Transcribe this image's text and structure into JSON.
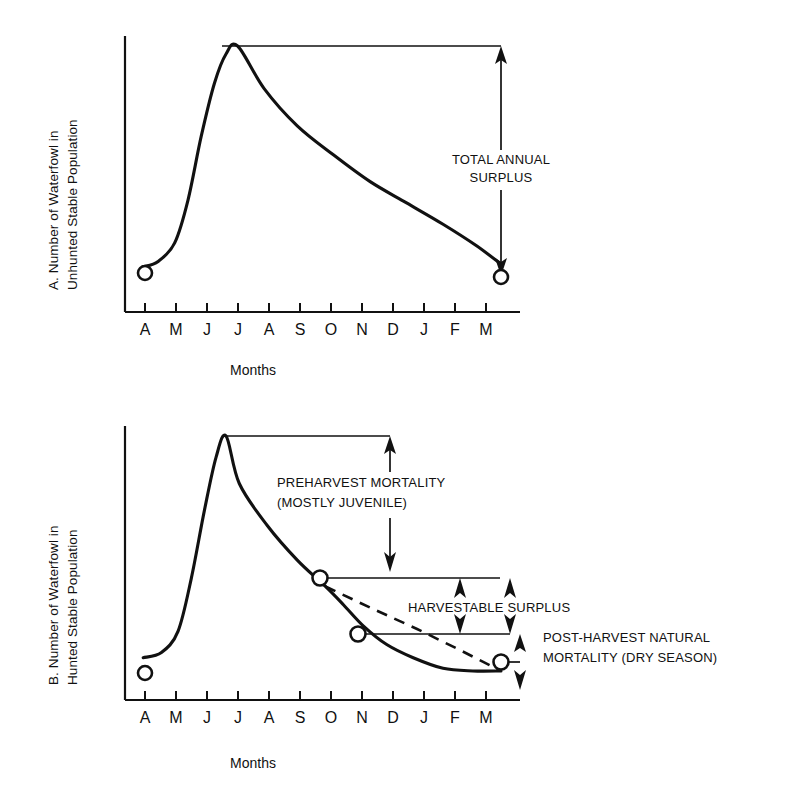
{
  "figure": {
    "background": "#ffffff",
    "line_color": "#111111"
  },
  "chart_data": [
    {
      "id": "panel-a",
      "type": "line",
      "title": "",
      "panel_letter": "A",
      "ylabel_line1": "A. Number of Waterfowl in",
      "ylabel_line2": "Unhunted Stable Population",
      "xlabel": "Months",
      "categories": [
        "A",
        "M",
        "J",
        "J",
        "A",
        "S",
        "O",
        "N",
        "D",
        "J",
        "F",
        "M"
      ],
      "tick_labels": [
        "A",
        "M",
        "J",
        "J",
        "A",
        "S",
        "O",
        "N",
        "D",
        "J",
        "F",
        "M"
      ],
      "grid": false,
      "legend": "none",
      "axis_ranges": {
        "x": [
          0,
          12
        ],
        "y": [
          0,
          100
        ]
      },
      "series": [
        {
          "name": "Unhunted stable population",
          "style": "solid",
          "comment": "Breeding-season recruitment peak in early July, then smooth decline back to the spring level.",
          "x": [
            0.55,
            1.0,
            1.5,
            1.9,
            2.3,
            2.7,
            3.05,
            3.4,
            4.2,
            5.2,
            6.3,
            7.4,
            8.5,
            9.6,
            10.6,
            11.35
          ],
          "values": [
            17,
            19,
            26,
            42,
            66,
            86,
            97,
            100,
            84,
            70,
            59,
            49,
            41,
            33,
            25,
            18
          ]
        }
      ],
      "markers": [
        {
          "name": "spring-start-point",
          "x": 0.55,
          "y": 17
        },
        {
          "name": "spring-end-point",
          "x": 11.35,
          "y": 18
        }
      ],
      "annotations": [
        {
          "name": "total-annual-surplus",
          "lines": [
            "TOTAL ANNUAL",
            "SURPLUS"
          ],
          "arrow": "double-vertical",
          "from_y": 100,
          "to_y": 18,
          "at_x": 11.35
        }
      ]
    },
    {
      "id": "panel-b",
      "type": "line",
      "title": "",
      "panel_letter": "B",
      "ylabel_line1": "B. Number of Waterfowl in",
      "ylabel_line2": "Hunted Stable Population",
      "xlabel": "Months",
      "categories": [
        "A",
        "M",
        "J",
        "J",
        "A",
        "S",
        "O",
        "N",
        "D",
        "J",
        "F",
        "M"
      ],
      "tick_labels": [
        "A",
        "M",
        "J",
        "J",
        "A",
        "S",
        "O",
        "N",
        "D",
        "J",
        "F",
        "M"
      ],
      "grid": false,
      "legend": "none",
      "axis_ranges": {
        "x": [
          0,
          12
        ],
        "y": [
          0,
          100
        ]
      },
      "series": [
        {
          "name": "Hunted stable population",
          "style": "solid",
          "comment": "Peak in early July, steep preharvest decline to October, harvest drop, then flattening dry-season tail.",
          "x": [
            0.55,
            1.1,
            1.6,
            2.0,
            2.4,
            2.75,
            3.05,
            3.45,
            4.3,
            5.2,
            6.05,
            6.6,
            7.2,
            7.9,
            8.7,
            9.6,
            10.5,
            11.35
          ],
          "values": [
            16,
            18,
            26,
            46,
            72,
            92,
            100,
            82,
            66,
            53,
            43,
            36,
            28,
            21,
            16,
            12,
            11,
            11
          ]
        },
        {
          "name": "Unhunted trajectory (reference)",
          "style": "dashed",
          "comment": "Dashed line showing the decline the population would have followed without harvest.",
          "x": [
            6.05,
            7.4,
            8.8,
            10.1,
            11.35
          ],
          "values": [
            43,
            35,
            27,
            19,
            11
          ]
        }
      ],
      "markers": [
        {
          "name": "spring-start-point",
          "x": 0.55,
          "y": 16
        },
        {
          "name": "preharvest-point",
          "x": 6.05,
          "y": 43
        },
        {
          "name": "postharvest-point",
          "x": 7.2,
          "y": 28
        },
        {
          "name": "dry-season-end-point",
          "x": 11.35,
          "y": 11
        }
      ],
      "annotations": [
        {
          "name": "preharvest-mortality",
          "lines": [
            "PREHARVEST MORTALITY",
            "(MOSTLY JUVENILE)"
          ],
          "arrow": "double-vertical",
          "from_y": 100,
          "to_y": 43,
          "at_x": 6.05
        },
        {
          "name": "harvestable-surplus",
          "lines": [
            "HARVESTABLE SURPLUS"
          ],
          "arrow": "double-vertical",
          "from_y": 43,
          "to_y": 28,
          "at_x": 7.2
        },
        {
          "name": "post-harvest-natural-mortality",
          "lines": [
            "POST-HARVEST NATURAL",
            "MORTALITY (DRY SEASON)"
          ],
          "arrow": "double-vertical",
          "from_y": 28,
          "to_y": 11,
          "at_x": 11.35
        }
      ]
    }
  ]
}
